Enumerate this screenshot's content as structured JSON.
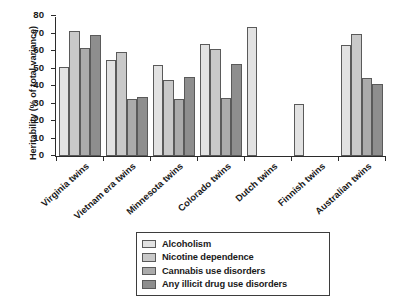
{
  "chart_data": {
    "type": "bar",
    "title": "",
    "xlabel": "",
    "ylabel": "Heritability (% of total variance)",
    "ylim": [
      0,
      80
    ],
    "yticks": [
      0,
      10,
      20,
      30,
      40,
      50,
      60,
      70,
      80
    ],
    "grid": false,
    "legend_position": "bottom-center",
    "categories": [
      "Virginia twins",
      "Vietnam era twins",
      "Minnesota twins",
      "Colorado twins",
      "Dutch twins",
      "Finnish twins",
      "Australian twins"
    ],
    "series": [
      {
        "name": "Alcoholism",
        "color": "#e2e2e2",
        "values": [
          51,
          55,
          52,
          64,
          74,
          30,
          63.5
        ]
      },
      {
        "name": "Nicotine dependence",
        "color": "#c9c9c9",
        "values": [
          71.5,
          59.5,
          43.5,
          61,
          null,
          null,
          70
        ]
      },
      {
        "name": "Cannabis use disorders",
        "color": "#ababab",
        "values": [
          62,
          32.5,
          32.5,
          33,
          null,
          null,
          44.5
        ]
      },
      {
        "name": "Any illicit drug use disorders",
        "color": "#8e8e8e",
        "values": [
          69,
          34,
          45,
          52.5,
          null,
          null,
          41
        ]
      }
    ]
  },
  "legend": {
    "items": [
      {
        "label": "Alcoholism"
      },
      {
        "label": "Nicotine dependence"
      },
      {
        "label": "Cannabis use disorders"
      },
      {
        "label": "Any illicit drug use disorders"
      }
    ]
  }
}
